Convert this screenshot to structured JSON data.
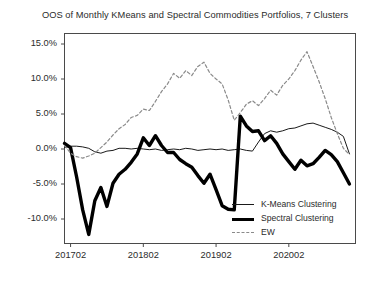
{
  "chart_data": {
    "type": "line",
    "title": "OOS of Monthly KMeans and Spectral Commodities Portfolios, 7 Clusters",
    "xlabel": "",
    "ylabel": "",
    "grid": false,
    "legend_position": "lower-right-inside",
    "xlim": [
      0,
      48
    ],
    "ylim": [
      -0.135,
      0.165
    ],
    "ytick_values": [
      0.15,
      0.1,
      0.05,
      0.0,
      -0.05,
      -0.1
    ],
    "ytick_labels": [
      "15.0%",
      "10.0%",
      "5.0%",
      "0.0%",
      "-5.0%",
      "-10.0%"
    ],
    "xtick_positions": [
      1,
      13,
      25,
      37
    ],
    "xtick_labels": [
      "201702",
      "201802",
      "201902",
      "202002"
    ],
    "x": [
      0,
      1,
      2,
      3,
      4,
      5,
      6,
      7,
      8,
      9,
      10,
      11,
      12,
      13,
      14,
      15,
      16,
      17,
      18,
      19,
      20,
      21,
      22,
      23,
      24,
      25,
      26,
      27,
      28,
      29,
      30,
      31,
      32,
      33,
      34,
      35,
      36,
      37,
      38,
      39,
      40,
      41,
      42,
      43,
      44,
      45,
      46,
      47
    ],
    "series": [
      {
        "name": "K-Means Clustering",
        "style": "solid-thin",
        "color": "#1a1a1a",
        "values": [
          0.002,
          0.004,
          0.004,
          0.003,
          0.001,
          -0.004,
          -0.006,
          -0.003,
          -0.002,
          0.001,
          0.001,
          0.0,
          0.001,
          0.0,
          -0.001,
          0.0,
          -0.002,
          -0.001,
          0.0,
          -0.001,
          0.001,
          0.0,
          -0.002,
          -0.001,
          0.0,
          -0.001,
          0.0,
          -0.002,
          -0.001,
          0.0,
          -0.002,
          -0.003,
          0.01,
          0.022,
          0.026,
          0.024,
          0.026,
          0.029,
          0.03,
          0.033,
          0.036,
          0.037,
          0.034,
          0.031,
          0.028,
          0.024,
          0.018,
          -0.007
        ]
      },
      {
        "name": "Spectral Clustering",
        "style": "solid-thick",
        "color": "#000000",
        "values": [
          0.008,
          0.002,
          -0.04,
          -0.087,
          -0.122,
          -0.074,
          -0.055,
          -0.082,
          -0.049,
          -0.036,
          -0.029,
          -0.019,
          -0.007,
          0.016,
          0.005,
          0.019,
          0.005,
          -0.005,
          -0.005,
          -0.015,
          -0.021,
          -0.026,
          -0.038,
          -0.049,
          -0.036,
          -0.058,
          -0.081,
          -0.086,
          -0.087,
          0.047,
          0.033,
          0.025,
          0.026,
          0.012,
          0.019,
          0.008,
          -0.007,
          -0.018,
          -0.029,
          -0.016,
          -0.024,
          -0.021,
          -0.012,
          -0.002,
          -0.008,
          -0.018,
          -0.034,
          -0.05
        ]
      },
      {
        "name": "EW",
        "style": "dashed",
        "color": "#8a8a8a",
        "values": [
          0.005,
          -0.006,
          -0.011,
          -0.013,
          -0.01,
          -0.006,
          0.002,
          0.01,
          0.02,
          0.029,
          0.035,
          0.045,
          0.048,
          0.057,
          0.055,
          0.068,
          0.082,
          0.093,
          0.108,
          0.101,
          0.112,
          0.105,
          0.118,
          0.124,
          0.108,
          0.1,
          0.093,
          0.07,
          0.041,
          0.052,
          0.064,
          0.069,
          0.062,
          0.072,
          0.084,
          0.077,
          0.091,
          0.1,
          0.112,
          0.127,
          0.139,
          0.118,
          0.096,
          0.072,
          0.045,
          0.022,
          0.001,
          -0.008
        ]
      }
    ]
  },
  "legend": {
    "items": [
      {
        "label": "K-Means Clustering"
      },
      {
        "label": "Spectral Clustering"
      },
      {
        "label": "EW"
      }
    ]
  },
  "axes": {
    "y_tick_labels": [
      "15.0%",
      "10.0%",
      "5.0%",
      "0.0%",
      "-5.0%",
      "-10.0%"
    ],
    "x_tick_labels": [
      "201702",
      "201802",
      "201902",
      "202002"
    ]
  }
}
